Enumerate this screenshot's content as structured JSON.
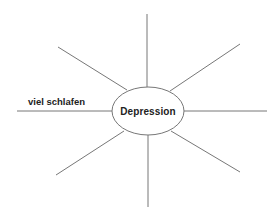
{
  "diagram": {
    "type": "mind-map",
    "center": {
      "label": "Depression",
      "cx": 148,
      "cy": 111,
      "rx": 36,
      "ry": 24
    },
    "branches": [
      {
        "id": "top",
        "x1": 147,
        "y1": 87,
        "x2": 147,
        "y2": 14,
        "label": ""
      },
      {
        "id": "upper-right",
        "x1": 170,
        "y1": 91,
        "x2": 240,
        "y2": 44,
        "label": ""
      },
      {
        "id": "right",
        "x1": 184,
        "y1": 111,
        "x2": 267,
        "y2": 111,
        "label": ""
      },
      {
        "id": "lower-right",
        "x1": 171,
        "y1": 131,
        "x2": 240,
        "y2": 172,
        "label": ""
      },
      {
        "id": "bottom",
        "x1": 148,
        "y1": 135,
        "x2": 148,
        "y2": 207,
        "label": ""
      },
      {
        "id": "lower-left",
        "x1": 124,
        "y1": 131,
        "x2": 56,
        "y2": 175,
        "label": ""
      },
      {
        "id": "left",
        "x1": 112,
        "y1": 111,
        "x2": 17,
        "y2": 111,
        "label": "viel schlafen"
      },
      {
        "id": "upper-left",
        "x1": 127,
        "y1": 90,
        "x2": 58,
        "y2": 47,
        "label": ""
      }
    ],
    "colors": {
      "line": "#777777",
      "text": "#222222",
      "background": "#ffffff"
    }
  }
}
